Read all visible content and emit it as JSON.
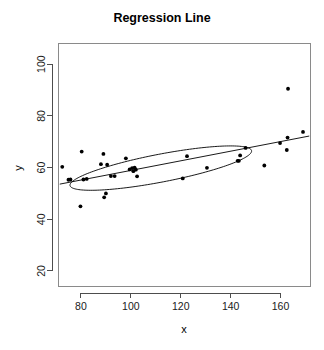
{
  "chart_data": {
    "type": "scatter",
    "title": "Regression Line",
    "xlabel": "x",
    "ylabel": "y",
    "xlim": [
      71,
      172
    ],
    "ylim": [
      14,
      108
    ],
    "xticks": [
      80,
      100,
      120,
      140,
      160
    ],
    "yticks": [
      20,
      40,
      60,
      80,
      100
    ],
    "grid": false,
    "legend": null,
    "point_color": "#000000",
    "line_color": "#000000",
    "frame_color": "#8a8a8a",
    "points": [
      {
        "x": 72.5,
        "y": 60.3
      },
      {
        "x": 75.0,
        "y": 55.3
      },
      {
        "x": 75.8,
        "y": 55.4
      },
      {
        "x": 79.8,
        "y": 45.0
      },
      {
        "x": 80.3,
        "y": 66.2
      },
      {
        "x": 81.0,
        "y": 55.4
      },
      {
        "x": 82.3,
        "y": 55.6
      },
      {
        "x": 88.0,
        "y": 61.3
      },
      {
        "x": 89.0,
        "y": 65.3
      },
      {
        "x": 89.3,
        "y": 48.5
      },
      {
        "x": 90.0,
        "y": 50.0
      },
      {
        "x": 90.5,
        "y": 61.1
      },
      {
        "x": 92.0,
        "y": 56.7
      },
      {
        "x": 93.5,
        "y": 56.7
      },
      {
        "x": 98.0,
        "y": 63.6
      },
      {
        "x": 99.5,
        "y": 59.3
      },
      {
        "x": 100.5,
        "y": 59.8
      },
      {
        "x": 101.0,
        "y": 58.6
      },
      {
        "x": 101.5,
        "y": 60.0
      },
      {
        "x": 102.0,
        "y": 59.2
      },
      {
        "x": 102.5,
        "y": 56.6
      },
      {
        "x": 120.8,
        "y": 55.8
      },
      {
        "x": 122.5,
        "y": 64.4
      },
      {
        "x": 130.5,
        "y": 59.9
      },
      {
        "x": 142.8,
        "y": 62.6
      },
      {
        "x": 143.3,
        "y": 62.6
      },
      {
        "x": 143.8,
        "y": 64.7
      },
      {
        "x": 146.0,
        "y": 67.6
      },
      {
        "x": 153.5,
        "y": 60.8
      },
      {
        "x": 159.8,
        "y": 69.5
      },
      {
        "x": 162.5,
        "y": 66.8
      },
      {
        "x": 162.8,
        "y": 71.6
      },
      {
        "x": 163.0,
        "y": 90.5
      },
      {
        "x": 169.0,
        "y": 73.8
      }
    ],
    "regression_line": {
      "x_start": 71.5,
      "y_start": 53.6,
      "x_end": 171.5,
      "y_end": 72.2
    },
    "ellipse": {
      "center_x": 112.0,
      "center_y": 59.8,
      "semi_major": 37.0,
      "semi_minor": 5.4,
      "angle_deg": 10.5
    }
  }
}
